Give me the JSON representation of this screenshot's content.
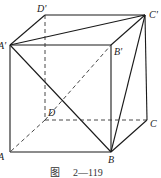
{
  "figure": {
    "caption_prefix": "图",
    "caption_number": "2—119"
  },
  "vertices": {
    "A_prime": {
      "label": "A'",
      "x": 10,
      "y": 45
    },
    "B_prime": {
      "label": "B'",
      "x": 111,
      "y": 45
    },
    "C_prime": {
      "label": "C'",
      "x": 145,
      "y": 15
    },
    "D_prime": {
      "label": "D'",
      "x": 45,
      "y": 15
    },
    "A": {
      "label": "A",
      "x": 10,
      "y": 152
    },
    "B": {
      "label": "B",
      "x": 111,
      "y": 152
    },
    "C": {
      "label": "C",
      "x": 147,
      "y": 120
    },
    "D": {
      "label": "D",
      "x": 45,
      "y": 120
    }
  },
  "solid_edges": [
    [
      "A_prime",
      "B_prime"
    ],
    [
      "B_prime",
      "C_prime"
    ],
    [
      "C_prime",
      "D_prime"
    ],
    [
      "D_prime",
      "A_prime"
    ],
    [
      "A_prime",
      "A"
    ],
    [
      "B_prime",
      "B"
    ],
    [
      "C_prime",
      "C"
    ],
    [
      "A",
      "B"
    ],
    [
      "B",
      "C"
    ],
    [
      "A_prime",
      "C_prime"
    ],
    [
      "A_prime",
      "B"
    ],
    [
      "B",
      "C_prime"
    ]
  ],
  "dashed_edges": [
    [
      "D_prime",
      "D"
    ],
    [
      "D",
      "A"
    ],
    [
      "D",
      "C"
    ],
    [
      "D",
      "B_prime"
    ]
  ]
}
